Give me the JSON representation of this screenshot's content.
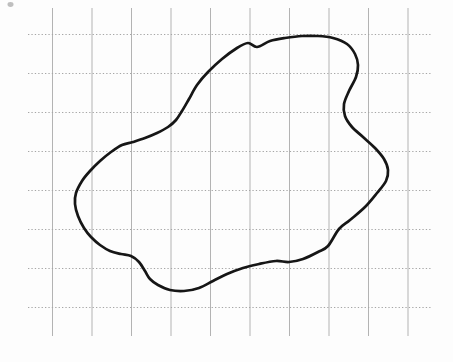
{
  "figure": {
    "width": 453,
    "height": 362,
    "background_color": "#fdfdfd",
    "curve": {
      "color": "#161616",
      "stroke_width": 2.7,
      "fill": "none"
    },
    "grid": {
      "vertical": {
        "count": 10,
        "x_start": 52.5,
        "spacing": 39.5,
        "y1": 8,
        "y2": 336,
        "color": "#b3b3b3",
        "width": 1,
        "dash": ""
      },
      "horizontal": {
        "count": 8,
        "y_start": 34.5,
        "spacing": 39,
        "x1": 28,
        "x2": 431,
        "color": "#a6a6a6",
        "width": 1.1,
        "dash": "1.3,2.1"
      }
    },
    "smudge": {
      "cx": 10.5,
      "cy": 4.5,
      "rx": 3,
      "ry": 2.4,
      "color": "#bfbfbf"
    },
    "blob_points": [
      [
        248,
        43
      ],
      [
        257,
        47
      ],
      [
        270,
        41
      ],
      [
        285,
        38
      ],
      [
        302,
        36
      ],
      [
        318,
        36
      ],
      [
        333,
        38
      ],
      [
        347,
        44
      ],
      [
        355,
        54
      ],
      [
        358,
        65
      ],
      [
        356,
        77
      ],
      [
        349,
        91
      ],
      [
        344,
        104
      ],
      [
        345,
        116
      ],
      [
        352,
        127
      ],
      [
        363,
        137
      ],
      [
        375,
        148
      ],
      [
        384,
        159
      ],
      [
        388,
        170
      ],
      [
        386,
        181
      ],
      [
        377,
        193
      ],
      [
        365,
        207
      ],
      [
        350,
        220
      ],
      [
        339,
        229
      ],
      [
        328,
        246
      ],
      [
        318,
        252
      ],
      [
        303,
        259
      ],
      [
        289,
        262
      ],
      [
        276,
        261
      ],
      [
        259,
        264
      ],
      [
        243,
        268
      ],
      [
        227,
        274
      ],
      [
        213,
        281
      ],
      [
        199,
        288
      ],
      [
        184,
        291
      ],
      [
        170,
        290
      ],
      [
        158,
        285
      ],
      [
        150,
        279
      ],
      [
        145,
        271
      ],
      [
        139,
        262
      ],
      [
        131,
        256
      ],
      [
        121,
        254
      ],
      [
        110,
        251
      ],
      [
        100,
        245
      ],
      [
        91,
        237
      ],
      [
        84,
        228
      ],
      [
        78,
        216
      ],
      [
        75,
        204
      ],
      [
        76,
        193
      ],
      [
        82,
        181
      ],
      [
        90,
        171
      ],
      [
        100,
        161
      ],
      [
        111,
        152
      ],
      [
        122,
        145
      ],
      [
        133,
        142
      ],
      [
        145,
        138
      ],
      [
        157,
        133
      ],
      [
        168,
        127
      ],
      [
        176,
        120
      ],
      [
        182,
        111
      ],
      [
        189,
        99
      ],
      [
        197,
        85
      ],
      [
        208,
        72
      ],
      [
        222,
        59
      ],
      [
        237,
        48
      ]
    ]
  }
}
